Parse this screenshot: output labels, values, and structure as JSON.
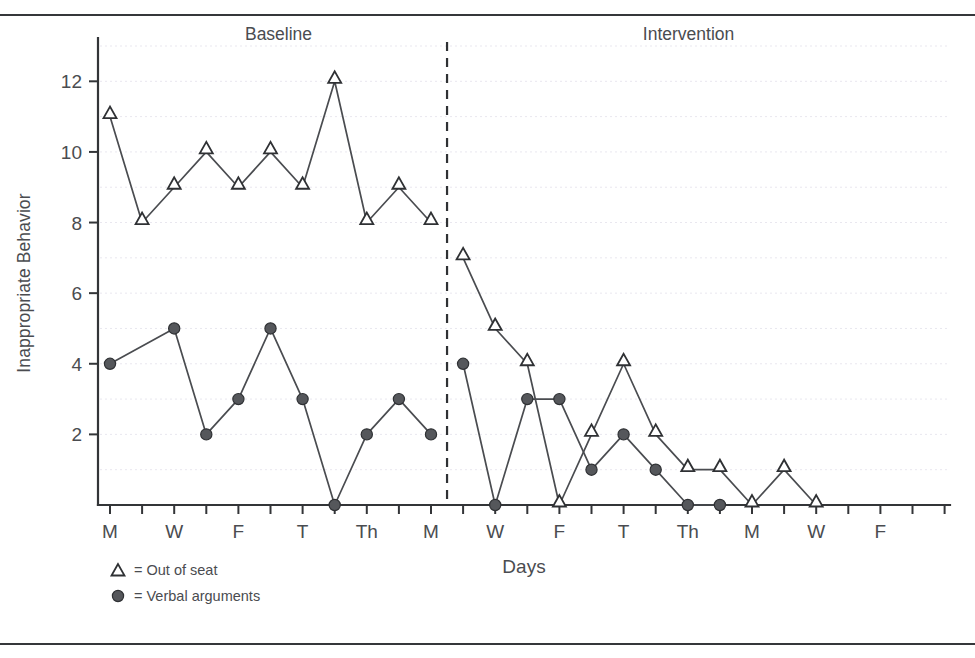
{
  "figure": {
    "has_top_rule": true,
    "has_bottom_rule": true
  },
  "chart_data": {
    "type": "line",
    "title": "",
    "xlabel": "Days",
    "ylabel": "Inappropriate Behavior",
    "ylim": [
      0,
      13
    ],
    "yticks": [
      2,
      4,
      6,
      8,
      10,
      12
    ],
    "ytick_labels": [
      "2",
      "4",
      "6",
      "8",
      "10",
      "12"
    ],
    "grid": true,
    "grid_axis": "y",
    "n_sessions": 24,
    "xtick_labels": [
      "M",
      "W",
      "F",
      "T",
      "Th",
      "M",
      "W",
      "F",
      "T",
      "Th",
      "M",
      "W",
      "F"
    ],
    "xtick_label_sessions": [
      1,
      3,
      5,
      7,
      9,
      11,
      13,
      15,
      17,
      19,
      21,
      23,
      25
    ],
    "phases": [
      {
        "name": "Baseline",
        "label": "Baseline",
        "start_session": 1,
        "end_session": 11
      },
      {
        "name": "Intervention",
        "label": "Intervention",
        "start_session": 12,
        "end_session": 24
      }
    ],
    "phase_change_line": {
      "after_session": 11,
      "style": "dashed"
    },
    "series": [
      {
        "name": "Out of seat",
        "marker": "triangle-open",
        "legend_label": "= Out of seat",
        "points": [
          {
            "session": 1,
            "value": 11
          },
          {
            "session": 2,
            "value": 8
          },
          {
            "session": 3,
            "value": 9
          },
          {
            "session": 4,
            "value": 10
          },
          {
            "session": 5,
            "value": 9
          },
          {
            "session": 6,
            "value": 10
          },
          {
            "session": 7,
            "value": 9
          },
          {
            "session": 8,
            "value": 12
          },
          {
            "session": 9,
            "value": 8
          },
          {
            "session": 10,
            "value": 9
          },
          {
            "session": 11,
            "value": 8
          },
          {
            "session": 12,
            "value": 7
          },
          {
            "session": 13,
            "value": 5
          },
          {
            "session": 14,
            "value": 4
          },
          {
            "session": 15,
            "value": 0
          },
          {
            "session": 16,
            "value": 2
          },
          {
            "session": 17,
            "value": 4
          },
          {
            "session": 18,
            "value": 2
          },
          {
            "session": 19,
            "value": 1
          },
          {
            "session": 20,
            "value": 1
          },
          {
            "session": 21,
            "value": 0
          },
          {
            "session": 22,
            "value": 1
          },
          {
            "session": 23,
            "value": 0
          }
        ]
      },
      {
        "name": "Verbal arguments",
        "marker": "circle-filled",
        "legend_label": "= Verbal arguments",
        "points": [
          {
            "session": 1,
            "value": 4
          },
          {
            "session": 3,
            "value": 5
          },
          {
            "session": 4,
            "value": 2
          },
          {
            "session": 5,
            "value": 3
          },
          {
            "session": 6,
            "value": 5
          },
          {
            "session": 7,
            "value": 3
          },
          {
            "session": 8,
            "value": 0
          },
          {
            "session": 9,
            "value": 2
          },
          {
            "session": 10,
            "value": 3
          },
          {
            "session": 11,
            "value": 2
          },
          {
            "session": 12,
            "value": 4
          },
          {
            "session": 13,
            "value": 0
          },
          {
            "session": 14,
            "value": 3
          },
          {
            "session": 15,
            "value": 3
          },
          {
            "session": 16,
            "value": 1
          },
          {
            "session": 17,
            "value": 2
          },
          {
            "session": 18,
            "value": 1
          },
          {
            "session": 19,
            "value": 0
          },
          {
            "session": 20,
            "value": 0
          }
        ]
      }
    ],
    "legend": {
      "position": "below-axis-left",
      "entries": [
        {
          "symbol": "triangle-open",
          "text": "= Out of seat"
        },
        {
          "symbol": "circle-filled",
          "text": "= Verbal arguments"
        }
      ]
    },
    "colors": {
      "line": "#4a4c50",
      "marker_stroke": "#2f3134",
      "marker_fill_open": "#ffffff",
      "marker_fill_solid": "#55575b",
      "axis": "#333538",
      "grid": "#e9e7ef",
      "text": "#4a4c50",
      "background": "#ffffff"
    }
  }
}
